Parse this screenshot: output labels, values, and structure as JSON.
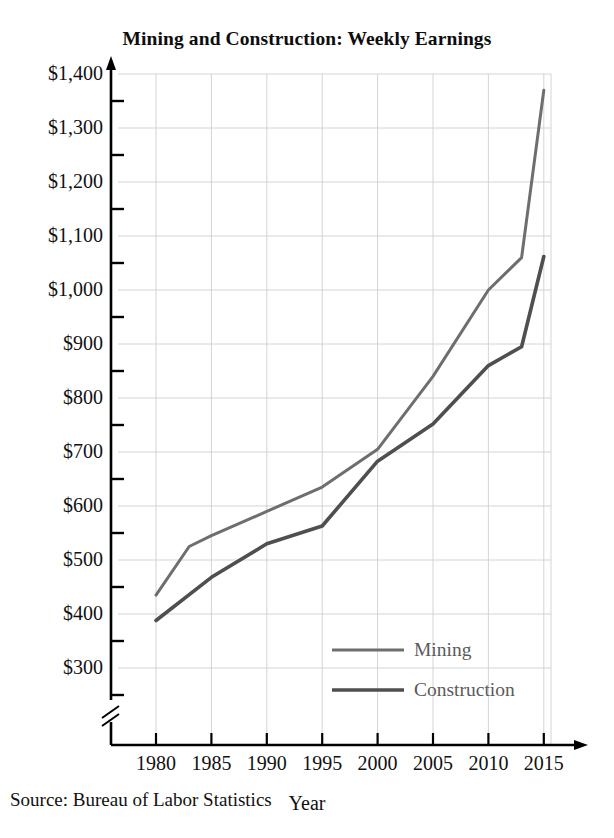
{
  "chart_data": {
    "type": "line",
    "title": "Mining and Construction: Weekly Earnings",
    "xlabel": "Year",
    "ylabel": "",
    "source": "Source: Bureau of Labor Statistics",
    "grid": true,
    "legend_position": "inside-bottom-right",
    "axis_break_x": true,
    "axis_break_y": true,
    "xlim": [
      1977,
      2017
    ],
    "ylim": [
      300,
      1400
    ],
    "xticks": [
      1980,
      1985,
      1990,
      1995,
      2000,
      2005,
      2010,
      2015
    ],
    "xtick_labels": [
      "1980",
      "1985",
      "1990",
      "1995",
      "2000",
      "2005",
      "2010",
      "2015"
    ],
    "yticks": [
      300,
      400,
      500,
      600,
      700,
      800,
      900,
      1000,
      1100,
      1200,
      1300,
      1400
    ],
    "ytick_labels": [
      "$300",
      "$400",
      "$500",
      "$600",
      "$700",
      "$800",
      "$900",
      "$1,000",
      "$1,100",
      "$1,200",
      "$1,300",
      "$1,400"
    ],
    "yminor_ticks": [
      250,
      350,
      450,
      550,
      650,
      750,
      850,
      950,
      1050,
      1150,
      1250,
      1350
    ],
    "series": [
      {
        "name": "Mining",
        "color": "#6e6e6e",
        "width": 3,
        "x": [
          1980,
          1983,
          1985,
          1990,
          1995,
          2000,
          2005,
          2010,
          2013,
          2015
        ],
        "values": [
          435,
          525,
          545,
          590,
          635,
          705,
          840,
          1000,
          1060,
          1370
        ]
      },
      {
        "name": "Construction",
        "color": "#4f4f4f",
        "width": 3.6,
        "x": [
          1980,
          1985,
          1990,
          1995,
          2000,
          2005,
          2010,
          2013,
          2015
        ],
        "values": [
          388,
          468,
          530,
          563,
          683,
          752,
          860,
          895,
          1062
        ]
      }
    ]
  },
  "legend": {
    "items": [
      {
        "label": "Mining",
        "color": "#6e6e6e"
      },
      {
        "label": "Construction",
        "color": "#4f4f4f"
      }
    ]
  },
  "colors": {
    "mining": "#6e6e6e",
    "construction": "#4f4f4f",
    "grid": "#c9c9c9",
    "axis": "#000000",
    "text": "#111111"
  }
}
